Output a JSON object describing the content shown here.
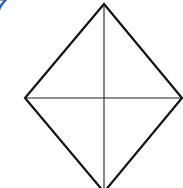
{
  "figure": {
    "label": "7",
    "label_color": "#2b5fa6",
    "shape": "rhombus",
    "stroke_color": "#111111",
    "vertices": {
      "top": [
        104,
        4
      ],
      "right": [
        182,
        98
      ],
      "bottom": [
        104,
        192
      ],
      "left": [
        25,
        98
      ]
    },
    "diagonals": [
      "vertical",
      "horizontal"
    ]
  }
}
